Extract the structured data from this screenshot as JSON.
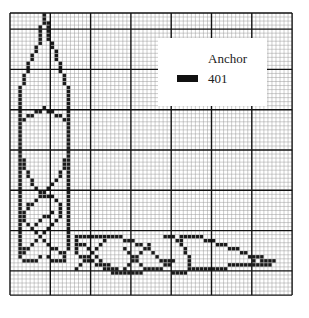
{
  "chart": {
    "type": "cross-stitch-chart",
    "grid": {
      "cols": 70,
      "rows": 70,
      "cell_px": 4.03,
      "origin": [
        10,
        13
      ],
      "major_every": 10,
      "major_col_offset": 0,
      "major_row_offset": 4
    },
    "colors": {
      "stitch": "#1a1a1a",
      "minor_line": "#9a9a9a",
      "major_line": "#111111",
      "background": "#ffffff"
    },
    "motif": "celtic knotwork corner border"
  },
  "legend": {
    "title": "Anchor",
    "items": [
      {
        "swatch_color": "#111111",
        "code": "401"
      }
    ]
  },
  "stitch_paths": [
    [
      [
        8,
        0
      ],
      [
        8,
        1
      ],
      [
        7,
        3
      ],
      [
        7,
        6
      ],
      [
        6,
        8
      ],
      [
        5,
        10
      ],
      [
        4,
        13
      ],
      [
        3,
        16
      ],
      [
        2,
        19
      ],
      [
        2,
        24
      ],
      [
        2,
        26
      ],
      [
        2,
        32
      ],
      [
        2,
        34
      ],
      [
        3,
        37
      ],
      [
        4,
        40
      ],
      [
        5,
        42
      ],
      [
        7,
        44
      ],
      [
        8,
        45
      ],
      [
        10,
        45
      ],
      [
        12,
        47
      ],
      [
        12,
        49
      ],
      [
        11,
        51
      ],
      [
        9,
        53
      ],
      [
        7,
        55
      ],
      [
        5,
        57
      ],
      [
        3,
        58
      ],
      [
        2,
        60
      ],
      [
        3,
        61
      ],
      [
        5,
        61
      ],
      [
        7,
        60
      ]
    ],
    [
      [
        8,
        1
      ],
      [
        9,
        3
      ],
      [
        9,
        6
      ],
      [
        10,
        8
      ],
      [
        11,
        10
      ],
      [
        12,
        13
      ],
      [
        13,
        16
      ],
      [
        14,
        19
      ],
      [
        14,
        24
      ],
      [
        14,
        26
      ],
      [
        14,
        32
      ],
      [
        14,
        34
      ],
      [
        13,
        37
      ],
      [
        12,
        40
      ],
      [
        10,
        42
      ],
      [
        8,
        44
      ],
      [
        6,
        46
      ],
      [
        4,
        47
      ],
      [
        3,
        49
      ],
      [
        3,
        51
      ],
      [
        5,
        53
      ],
      [
        7,
        55
      ],
      [
        9,
        57
      ],
      [
        11,
        58
      ],
      [
        13,
        59
      ],
      [
        13,
        61
      ],
      [
        11,
        61
      ],
      [
        9,
        60
      ]
    ],
    [
      [
        2,
        26
      ],
      [
        4,
        25
      ],
      [
        6,
        24
      ],
      [
        8,
        23
      ],
      [
        10,
        24
      ],
      [
        12,
        25
      ],
      [
        14,
        26
      ]
    ],
    [
      [
        2,
        33
      ],
      [
        2,
        40
      ],
      [
        2,
        47
      ]
    ],
    [
      [
        14,
        33
      ],
      [
        14,
        40
      ],
      [
        14,
        47
      ]
    ],
    [
      [
        2,
        47
      ],
      [
        2,
        52
      ],
      [
        2,
        60
      ]
    ],
    [
      [
        14,
        47
      ],
      [
        14,
        52
      ],
      [
        14,
        58
      ]
    ],
    [
      [
        6,
        52
      ],
      [
        8,
        50
      ],
      [
        10,
        49
      ]
    ],
    [
      [
        16,
        55
      ],
      [
        26,
        55
      ],
      [
        30,
        56
      ],
      [
        32,
        57
      ],
      [
        34,
        58
      ],
      [
        36,
        60
      ],
      [
        38,
        61
      ],
      [
        40,
        61
      ],
      [
        38,
        62
      ],
      [
        36,
        63
      ],
      [
        34,
        63
      ],
      [
        30,
        64
      ],
      [
        26,
        64
      ],
      [
        24,
        63
      ],
      [
        22,
        62
      ],
      [
        20,
        61
      ],
      [
        18,
        60
      ],
      [
        16,
        59
      ],
      [
        16,
        57
      ],
      [
        16,
        55
      ]
    ],
    [
      [
        16,
        56
      ],
      [
        18,
        57
      ],
      [
        20,
        59
      ],
      [
        22,
        61
      ],
      [
        24,
        62
      ],
      [
        26,
        63
      ],
      [
        28,
        64
      ]
    ],
    [
      [
        24,
        55
      ],
      [
        22,
        57
      ],
      [
        20,
        59
      ],
      [
        18,
        61
      ],
      [
        16,
        63
      ]
    ],
    [
      [
        28,
        58
      ],
      [
        30,
        60
      ],
      [
        32,
        62
      ],
      [
        34,
        63
      ]
    ],
    [
      [
        34,
        57
      ],
      [
        32,
        59
      ],
      [
        30,
        61
      ],
      [
        28,
        63
      ]
    ],
    [
      [
        38,
        55
      ],
      [
        40,
        55
      ],
      [
        42,
        56
      ],
      [
        42,
        57
      ],
      [
        43,
        59
      ],
      [
        44,
        61
      ],
      [
        44,
        63
      ],
      [
        43,
        64
      ],
      [
        40,
        64
      ]
    ],
    [
      [
        42,
        55
      ],
      [
        46,
        55
      ],
      [
        50,
        56
      ],
      [
        52,
        57
      ],
      [
        55,
        58
      ],
      [
        58,
        59
      ],
      [
        60,
        60
      ],
      [
        63,
        61
      ],
      [
        65,
        61
      ]
    ],
    [
      [
        44,
        63
      ],
      [
        48,
        63
      ],
      [
        52,
        63
      ],
      [
        55,
        62
      ],
      [
        58,
        62
      ],
      [
        62,
        62
      ],
      [
        64,
        62
      ],
      [
        65,
        61
      ]
    ],
    [
      [
        60,
        60
      ],
      [
        60,
        62
      ]
    ],
    [
      [
        62,
        60
      ],
      [
        62,
        62
      ]
    ],
    [
      [
        64,
        61
      ],
      [
        64,
        62
      ]
    ]
  ]
}
